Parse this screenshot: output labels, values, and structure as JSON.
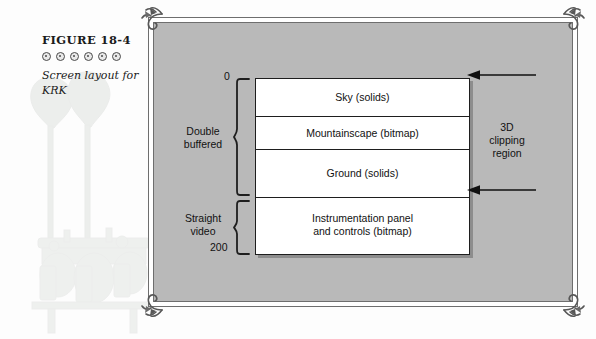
{
  "caption": {
    "figure_number": "FIGURE 18-4",
    "ornament_count": 6,
    "ornament_icon": "circle-dot-ornament",
    "description": "Screen layout for KRK"
  },
  "figure": {
    "background_color": "#b9b9b9",
    "frame_color": "#6e6e6e",
    "box_color": "#ffffff",
    "line_color": "#1e1e1e",
    "corner_ornament_icon": "flourish-scroll-icon",
    "watermark_icon": "antique-lab-apparatus-watermark"
  },
  "scale": {
    "top_label": "0",
    "bottom_label": "200"
  },
  "groups": [
    {
      "label": "Double\nbuffered",
      "line1": "Double",
      "line2": "buffered",
      "brace_icon": "curly-brace-icon"
    },
    {
      "label": "Straight\nvideo",
      "line1": "Straight",
      "line2": "video",
      "brace_icon": "curly-brace-icon"
    }
  ],
  "bands": [
    {
      "id": "sky",
      "line1": "Sky (solids)",
      "line2": ""
    },
    {
      "id": "mountain",
      "line1": "Mountainscape (bitmap)",
      "line2": ""
    },
    {
      "id": "ground",
      "line1": "Ground (solids)",
      "line2": ""
    },
    {
      "id": "instrument",
      "line1": "Instrumentation panel",
      "line2": "and controls (bitmap)"
    }
  ],
  "annotation": {
    "line1": "3D",
    "line2": "clipping",
    "line3": "region",
    "arrow_icon": "arrow-left-icon",
    "arrow_count": 2
  }
}
